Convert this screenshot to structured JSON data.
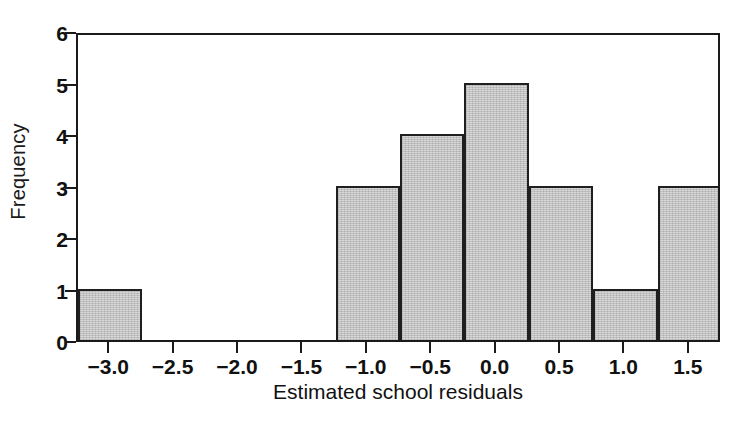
{
  "chart_data": {
    "type": "bar",
    "title": "",
    "subtitle": "",
    "xlabel": "Estimated school residuals",
    "ylabel": "Frequency",
    "xlim": [
      -3.25,
      1.75
    ],
    "ylim": [
      0,
      6
    ],
    "bin_width": 0.5,
    "grid": false,
    "legend": null,
    "xticks": [
      -3.0,
      -2.5,
      -2.0,
      -1.5,
      -1.0,
      -0.5,
      0.0,
      0.5,
      1.0,
      1.5
    ],
    "xtick_labels": [
      "−3.0",
      "−2.5",
      "−2.0",
      "−1.5",
      "−1.0",
      "−0.5",
      "0.0",
      "0.5",
      "1.0",
      "1.5"
    ],
    "yticks": [
      0,
      1,
      2,
      3,
      4,
      5,
      6
    ],
    "ytick_labels": [
      "0",
      "1",
      "2",
      "3",
      "4",
      "5",
      "6"
    ],
    "bins": [
      {
        "label": "[-3.25, -2.75)",
        "left": -3.25,
        "right": -2.75,
        "value": 1
      },
      {
        "label": "[-2.75, -2.25)",
        "left": -2.75,
        "right": -2.25,
        "value": 0
      },
      {
        "label": "[-2.25, -1.75)",
        "left": -2.25,
        "right": -1.75,
        "value": 0
      },
      {
        "label": "[-1.75, -1.25)",
        "left": -1.75,
        "right": -1.25,
        "value": 0
      },
      {
        "label": "[-1.25, -0.75)",
        "left": -1.25,
        "right": -0.75,
        "value": 3
      },
      {
        "label": "[-0.75, -0.25)",
        "left": -0.75,
        "right": -0.25,
        "value": 4
      },
      {
        "label": "[-0.25, 0.25)",
        "left": -0.25,
        "right": 0.25,
        "value": 5
      },
      {
        "label": "[0.25, 0.75)",
        "left": 0.25,
        "right": 0.75,
        "value": 3
      },
      {
        "label": "[0.75, 1.25)",
        "left": 0.75,
        "right": 1.25,
        "value": 1
      },
      {
        "label": "[1.25, 1.75)",
        "left": 1.25,
        "right": 1.75,
        "value": 3
      }
    ],
    "categories": [
      "[-3.25, -2.75)",
      "[-2.75, -2.25)",
      "[-2.25, -1.75)",
      "[-1.75, -1.25)",
      "[-1.25, -0.75)",
      "[-0.75, -0.25)",
      "[-0.25, 0.25)",
      "[0.25, 0.75)",
      "[0.75, 1.25)",
      "[1.25, 1.75)"
    ],
    "values": [
      1,
      0,
      0,
      0,
      3,
      4,
      5,
      3,
      1,
      3
    ],
    "total_count": 20,
    "colors": {
      "bar_fill": "#c9c9c9",
      "bar_edge": "#1f1f1f",
      "axis": "#1a1a1a",
      "text": "#111111",
      "background": "#ffffff"
    }
  }
}
